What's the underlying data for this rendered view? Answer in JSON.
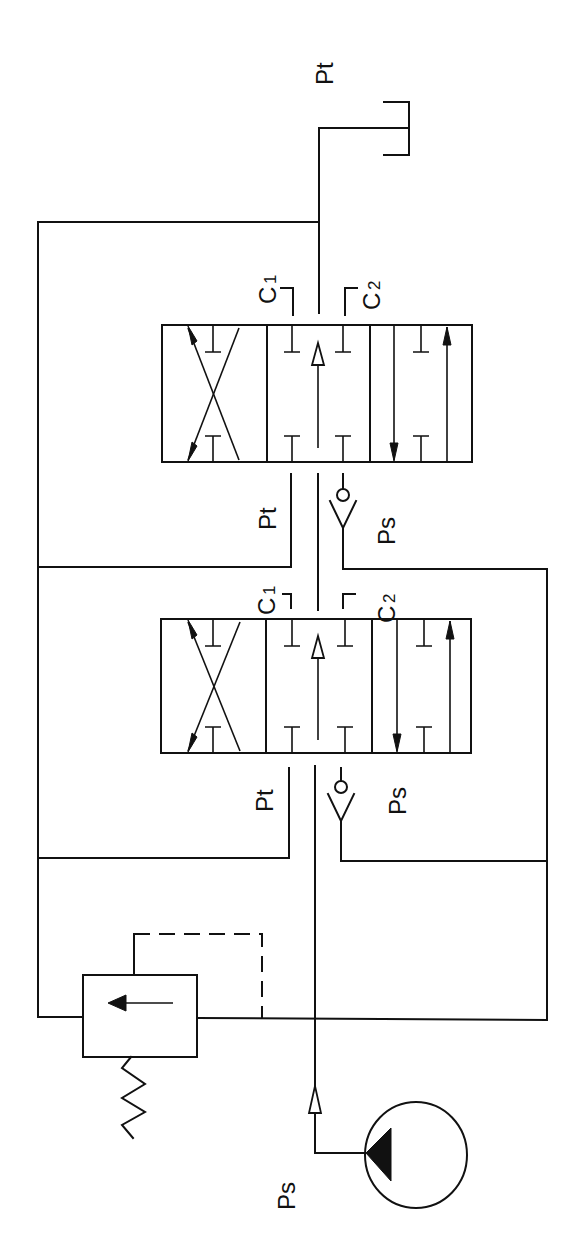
{
  "diagram": {
    "type": "hydraulic-circuit-schematic",
    "orientation": "rotated-90-ccw",
    "colors": {
      "line": "#111111",
      "background": "#ffffff"
    },
    "labels": {
      "tank_pressure_top": "Pt",
      "valve_upper": {
        "c1": "C",
        "c1_sub": "1",
        "c2": "C",
        "c2_sub": "2",
        "pt": "Pt",
        "ps": "Ps"
      },
      "valve_lower": {
        "c1": "C",
        "c1_sub": "1",
        "c2": "C",
        "c2_sub": "2",
        "pt": "Pt",
        "ps": "Ps"
      },
      "pump_supply": "Ps"
    },
    "components": [
      {
        "id": "tank",
        "label": "Pt",
        "symbol": "tank-icon"
      },
      {
        "id": "directional-valve-upper",
        "symbol": "4-way-3-position-valve",
        "ports": [
          "C1",
          "C2",
          "Pt",
          "Ps"
        ]
      },
      {
        "id": "directional-valve-lower",
        "symbol": "4-way-3-position-valve",
        "ports": [
          "C1",
          "C2",
          "Pt",
          "Ps"
        ]
      },
      {
        "id": "check-valve-upper",
        "symbol": "check-valve-icon"
      },
      {
        "id": "check-valve-lower",
        "symbol": "check-valve-icon"
      },
      {
        "id": "relief-valve",
        "symbol": "pressure-relief-valve-icon",
        "spring": true,
        "pilot": "dashed"
      },
      {
        "id": "pump",
        "label": "Ps",
        "symbol": "pump-icon"
      }
    ]
  }
}
